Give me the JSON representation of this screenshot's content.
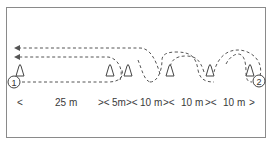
{
  "diagram": {
    "type": "running-drill-course",
    "colors": {
      "frame": "#8a8a8a",
      "path": "#555555",
      "cone": "#444444",
      "text": "#3a3a3a"
    },
    "markers": [
      {
        "id": "start",
        "label": "1"
      },
      {
        "id": "finish",
        "label": "2"
      }
    ],
    "cones": 6,
    "distances": [
      {
        "label": "<"
      },
      {
        "label": "25 m"
      },
      {
        "label": "><"
      },
      {
        "label": "5m"
      },
      {
        "label": "><"
      },
      {
        "label": "10 m"
      },
      {
        "label": "><"
      },
      {
        "label": "10 m"
      },
      {
        "label": "><"
      },
      {
        "label": "10 m"
      },
      {
        "label": ">"
      }
    ]
  }
}
